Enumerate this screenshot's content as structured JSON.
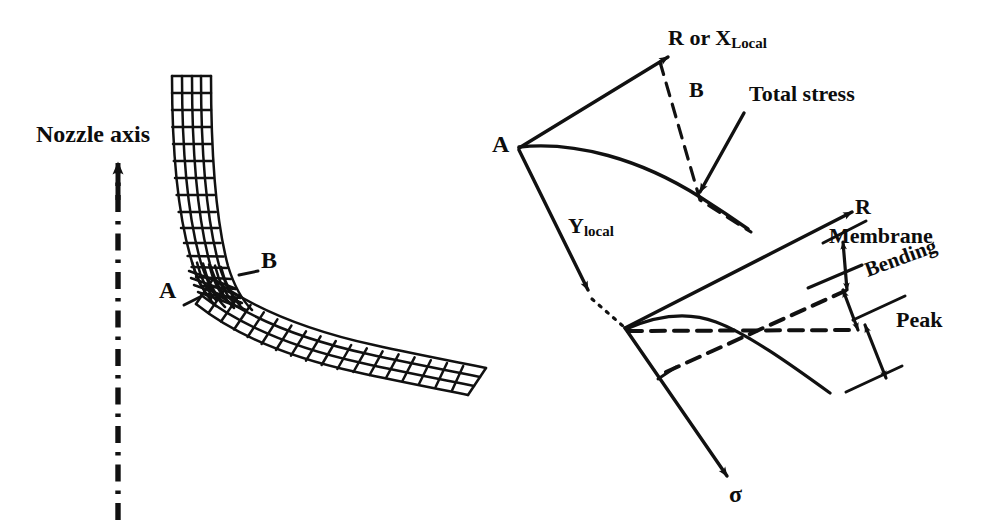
{
  "figure": {
    "kind": "engineering-diagram"
  },
  "left_panel": {
    "axis_label": "Nozzle axis",
    "axis_icon": "up-arrow-dash-dot-axis",
    "mesh_name": "nozzle-junction-mesh",
    "point_labels": [
      {
        "id": "A",
        "text": "A"
      },
      {
        "id": "B",
        "text": "B"
      }
    ]
  },
  "right_panel": {
    "upper": {
      "axis_r_x": "R or X",
      "axis_r_x_sub": "Local",
      "axis_y": "Y",
      "axis_y_sub": "local",
      "origin_label": "A",
      "mid_label": "B",
      "callout": "Total stress"
    },
    "lower": {
      "axis_r": "R",
      "axis_sigma": "σ",
      "components": [
        {
          "name": "membrane",
          "label": "Membrane"
        },
        {
          "name": "bending",
          "label": "Bending"
        },
        {
          "name": "peak",
          "label": "Peak"
        }
      ]
    }
  },
  "colors": {
    "ink": "#111111",
    "background": "#ffffff"
  }
}
